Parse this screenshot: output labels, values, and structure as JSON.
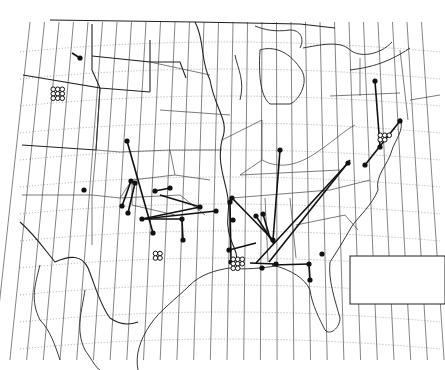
{
  "figure": {
    "type": "map",
    "region": "Central and Eastern United States",
    "background": "#ffffff",
    "ink": "#111111"
  },
  "graticule": {
    "meridian_count": 28,
    "parallel_count": 12
  },
  "tracks": [
    {
      "from": [
        72,
        53
      ],
      "to": [
        80,
        58
      ]
    },
    {
      "from": [
        127,
        141
      ],
      "to": [
        153,
        233
      ]
    },
    {
      "from": [
        131,
        181
      ],
      "to": [
        122,
        206
      ]
    },
    {
      "from": [
        135,
        183
      ],
      "to": [
        128,
        213
      ]
    },
    {
      "from": [
        155,
        191
      ],
      "to": [
        170,
        188
      ]
    },
    {
      "from": [
        160,
        195
      ],
      "to": [
        200,
        207
      ]
    },
    {
      "from": [
        200,
        207
      ],
      "to": [
        142,
        219
      ]
    },
    {
      "from": [
        143,
        219
      ],
      "to": [
        216,
        211
      ]
    },
    {
      "from": [
        145,
        219
      ],
      "to": [
        182,
        219
      ]
    },
    {
      "from": [
        182,
        220
      ],
      "to": [
        183,
        240
      ]
    },
    {
      "from": [
        232,
        198
      ],
      "to": [
        273,
        240
      ]
    },
    {
      "from": [
        256,
        216
      ],
      "to": [
        274,
        244
      ]
    },
    {
      "from": [
        280,
        150
      ],
      "to": [
        273,
        240
      ]
    },
    {
      "from": [
        263,
        214
      ],
      "to": [
        270,
        238
      ]
    },
    {
      "from": [
        229,
        250
      ],
      "to": [
        256,
        243
      ]
    },
    {
      "from": [
        230,
        202
      ],
      "to": [
        231,
        262
      ]
    },
    {
      "from": [
        256,
        263
      ],
      "to": [
        348,
        163
      ]
    },
    {
      "from": [
        269,
        262
      ],
      "to": [
        350,
        160
      ]
    },
    {
      "from": [
        375,
        81
      ],
      "to": [
        380,
        147
      ]
    },
    {
      "from": [
        400,
        121
      ],
      "to": [
        365,
        165
      ]
    },
    {
      "from": [
        250,
        263
      ],
      "to": [
        276,
        264
      ]
    },
    {
      "from": [
        272,
        265
      ],
      "to": [
        309,
        264
      ]
    },
    {
      "from": [
        309,
        264
      ],
      "to": [
        310,
        280
      ]
    }
  ],
  "points": [
    [
      80,
      58
    ],
    [
      84,
      190
    ],
    [
      127,
      141
    ],
    [
      122,
      206
    ],
    [
      128,
      213
    ],
    [
      153,
      233
    ],
    [
      131,
      181
    ],
    [
      135,
      183
    ],
    [
      155,
      191
    ],
    [
      170,
      188
    ],
    [
      200,
      207
    ],
    [
      142,
      219
    ],
    [
      216,
      211
    ],
    [
      183,
      240
    ],
    [
      182,
      219
    ],
    [
      232,
      198
    ],
    [
      273,
      240
    ],
    [
      256,
      216
    ],
    [
      263,
      214
    ],
    [
      229,
      250
    ],
    [
      230,
      202
    ],
    [
      231,
      262
    ],
    [
      280,
      150
    ],
    [
      348,
      163
    ],
    [
      375,
      81
    ],
    [
      380,
      147
    ],
    [
      400,
      121
    ],
    [
      365,
      165
    ],
    [
      309,
      264
    ],
    [
      310,
      280
    ],
    [
      322,
      254
    ],
    [
      233,
      220
    ],
    [
      276,
      264
    ],
    [
      262,
      268
    ]
  ],
  "clusters": [
    {
      "name": "rocky-mountain-cluster",
      "x": 58,
      "y": 94,
      "count": 9
    },
    {
      "name": "texas-cluster",
      "x": 158,
      "y": 256,
      "count": 4
    },
    {
      "name": "gulf-coast-cluster",
      "x": 238,
      "y": 264,
      "count": 8
    },
    {
      "name": "chesapeake-cluster",
      "x": 385,
      "y": 140,
      "count": 5
    }
  ],
  "inset_box": {
    "x": 350,
    "y": 256,
    "width": 95,
    "height": 48
  }
}
